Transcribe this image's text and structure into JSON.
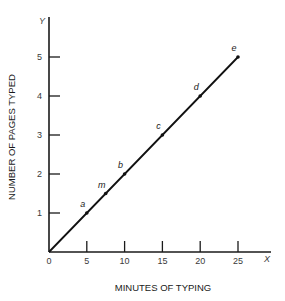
{
  "chart_data": {
    "type": "line",
    "title": "",
    "xlabel": "MINUTES OF TYPING",
    "ylabel": "NUMBER OF PAGES TYPED",
    "x_axis_letter": "X",
    "y_axis_letter": "Y",
    "xlim": [
      0,
      27
    ],
    "ylim": [
      0,
      5.5
    ],
    "x_ticks": [
      0,
      5,
      10,
      15,
      20,
      25
    ],
    "y_ticks": [
      1,
      2,
      3,
      4,
      5
    ],
    "grid": false,
    "legend": null,
    "series": [
      {
        "name": "pages typed",
        "x": [
          0,
          5,
          7.5,
          10,
          15,
          20,
          25
        ],
        "y": [
          0,
          1,
          1.5,
          2,
          3,
          4,
          5
        ]
      }
    ],
    "labeled_points": [
      {
        "label": "a",
        "x": 5,
        "y": 1
      },
      {
        "label": "m",
        "x": 7.5,
        "y": 1.5
      },
      {
        "label": "b",
        "x": 10,
        "y": 2
      },
      {
        "label": "c",
        "x": 15,
        "y": 3
      },
      {
        "label": "d",
        "x": 20,
        "y": 4
      },
      {
        "label": "e",
        "x": 25,
        "y": 5
      }
    ]
  }
}
